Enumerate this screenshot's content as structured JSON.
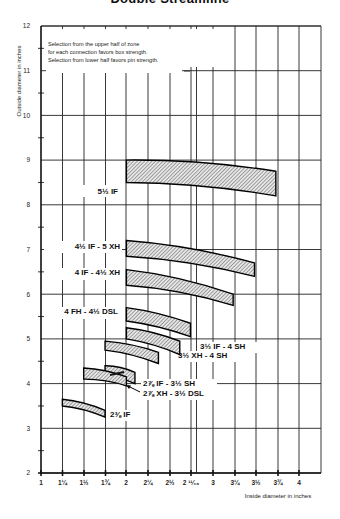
{
  "chart_data": {
    "type": "area",
    "title": "Double Streamline",
    "xlabel": "Inside diameter in inches",
    "ylabel": "Outside diameter in inches",
    "x_tick_labels": [
      "1",
      "1¼",
      "1½",
      "1¾",
      "2",
      "2¼",
      "2½",
      "2 ¹¹⁄₁₆",
      "3",
      "3¼",
      "3½",
      "3¾",
      "4"
    ],
    "x_tick_values": [
      1,
      1.25,
      1.5,
      1.75,
      2,
      2.25,
      2.5,
      2.6875,
      3,
      3.25,
      3.5,
      3.75,
      4
    ],
    "y_tick_labels": [
      "2",
      "3",
      "4",
      "5",
      "6",
      "7",
      "8",
      "9",
      "10",
      "11",
      "12"
    ],
    "ylim": [
      2,
      12
    ],
    "xlim": [
      1,
      4.25
    ],
    "grid": true,
    "annotation": [
      "Selection from the upper half of zone",
      "for each connection favors box strength.",
      "Selection from lower half favors pin strength."
    ],
    "series": [
      {
        "name": "5½ IF",
        "x_start": 2,
        "x_end": 3.75,
        "upper": [
          9.0,
          8.75
        ],
        "lower": [
          8.5,
          8.2
        ]
      },
      {
        "name": "4½ IF - 5 XH",
        "x_start": 2,
        "x_end": 3.5,
        "upper": [
          7.2,
          6.7
        ],
        "lower": [
          6.85,
          6.4
        ]
      },
      {
        "name": "4 IF - 4½ XH",
        "x_start": 2,
        "x_end": 3.25,
        "upper": [
          6.55,
          6.0
        ],
        "lower": [
          6.2,
          5.75
        ]
      },
      {
        "name": "4 FH - 4½ DSL",
        "x_start": 2,
        "x_end": 2.75,
        "upper": [
          5.7,
          5.35
        ],
        "lower": [
          5.4,
          5.05
        ]
      },
      {
        "name": "3½ IF - 4 SH",
        "x_start": 2,
        "x_end": 2.625,
        "upper": [
          5.25,
          4.95
        ],
        "lower": [
          5.0,
          4.65
        ]
      },
      {
        "name": "3½ XH - 4 SH",
        "x_start": 1.75,
        "x_end": 2.375,
        "upper": [
          4.95,
          4.7
        ],
        "lower": [
          4.75,
          4.45
        ]
      },
      {
        "name": "2⅞ IF - 3½ SH",
        "x_start": 1.75,
        "x_end": 2.1,
        "upper": [
          4.4,
          4.25
        ],
        "lower": [
          4.15,
          4.0
        ]
      },
      {
        "name": "2⅞ XH - 3½ DSL",
        "x_start": 1.5,
        "x_end": 2.0,
        "upper": [
          4.35,
          4.15
        ],
        "lower": [
          4.1,
          3.95
        ]
      },
      {
        "name": "2⅜ IF",
        "x_start": 1.25,
        "x_end": 1.75,
        "upper": [
          3.65,
          3.4
        ],
        "lower": [
          3.5,
          3.25
        ]
      }
    ]
  }
}
